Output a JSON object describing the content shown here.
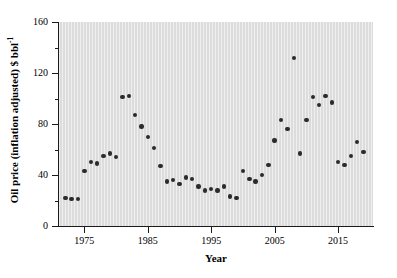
{
  "chart_data": {
    "type": "scatter",
    "title": "",
    "xlabel": "Year",
    "ylabel": "Oil price (inflation adjusted) $ bbl",
    "ylabel_exponent": "-1",
    "xlim": [
      1971,
      2020.5
    ],
    "ylim": [
      0,
      160
    ],
    "xticks": [
      1975,
      1985,
      1995,
      2005,
      2015
    ],
    "xtick_labels": [
      "1975",
      "1985",
      "1995",
      "2005",
      "2015"
    ],
    "yticks": [
      0,
      40,
      80,
      120,
      160
    ],
    "ytick_labels": [
      "0",
      "40",
      "80",
      "120",
      "160"
    ],
    "yticks_minor": [
      20,
      60,
      100,
      140
    ],
    "grid": false,
    "legend": null,
    "marker_color": "#2b2b2b",
    "plot_background": "#dcdcdc",
    "axis_color": "#1a1a1a",
    "x": [
      1972,
      1973,
      1974,
      1975,
      1976,
      1977,
      1978,
      1979,
      1980,
      1981,
      1982,
      1983,
      1984,
      1985,
      1986,
      1987,
      1988,
      1989,
      1990,
      1991,
      1992,
      1993,
      1994,
      1995,
      1996,
      1997,
      1998,
      1999,
      2000,
      2001,
      2002,
      2003,
      2004,
      2005,
      2006,
      2007,
      2008,
      2009,
      2010,
      2011,
      2012,
      2013,
      2014,
      2015,
      2016,
      2017,
      2018,
      2019
    ],
    "y": [
      22,
      21,
      21,
      43,
      50,
      49,
      55,
      57,
      54,
      101,
      102,
      87,
      78,
      70,
      61,
      47,
      35,
      36,
      33,
      38,
      37,
      31,
      28,
      29,
      28,
      31,
      23,
      22,
      43,
      37,
      35,
      40,
      48,
      67,
      83,
      76,
      132,
      57,
      83,
      101,
      95,
      102,
      97,
      50,
      48,
      55,
      66,
      58
    ],
    "series_name": "Oil price (inflation adjusted)"
  },
  "axes": {
    "x_axis_title": "Year",
    "y_axis_title_main": "Oil price (inflation adjusted) $ bbl",
    "y_axis_title_sup": "-1"
  }
}
